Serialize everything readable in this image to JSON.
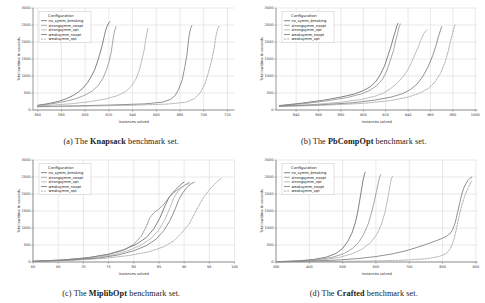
{
  "figure": {
    "axis_titles": {
      "x": "Instances solved",
      "y": "Total runtime in seconds"
    },
    "legend_title": "Configuration",
    "series_names": [
      "no_symm_breaking",
      "strongsymm_noopt",
      "strongsymm_opt",
      "weaksymm_noopt",
      "weaksymm_opt"
    ],
    "series_colors": [
      "#5a5a5a",
      "#8a8a8a",
      "#a8a8a8",
      "#6e6e6e",
      "#9a9a9a"
    ],
    "series_dashes": [
      "none",
      "none",
      "none",
      "none",
      "2,1.2"
    ]
  },
  "panels": [
    {
      "id": "a",
      "caption_prefix": "(a) The ",
      "caption_name": "Knapsack",
      "caption_suffix": " benchmark set.",
      "chart_data": {
        "type": "line",
        "title": "The Knapsack benchmark set.",
        "xlabel": "Instances solved",
        "ylabel": "Total runtime in seconds",
        "xlim": [
          556,
          726
        ],
        "ylim": [
          0,
          3000
        ],
        "xticks": [
          560,
          580,
          600,
          620,
          640,
          660,
          680,
          700,
          720
        ],
        "yticks": [
          0,
          500,
          1000,
          1500,
          2000,
          2500,
          3000
        ],
        "grid": true,
        "legend_position": "upper-left",
        "series": [
          {
            "name": "no_symm_breaking",
            "x": [
              560,
              566,
              572,
              578,
              584,
              590,
              594,
              598,
              602,
              605,
              608,
              610,
              612,
              614,
              615,
              616,
              617,
              618,
              619,
              620,
              621
            ],
            "y": [
              140,
              170,
              210,
              260,
              330,
              430,
              520,
              640,
              800,
              980,
              1180,
              1380,
              1600,
              1850,
              2000,
              2150,
              2300,
              2420,
              2500,
              2560,
              2600
            ]
          },
          {
            "name": "strongsymm_noopt",
            "x": [
              560,
              568,
              576,
              584,
              592,
              600,
              606,
              611,
              615,
              618,
              620,
              622,
              623,
              624,
              625,
              626
            ],
            "y": [
              130,
              165,
              205,
              260,
              330,
              440,
              560,
              720,
              930,
              1180,
              1400,
              1700,
              1950,
              2180,
              2350,
              2450
            ]
          },
          {
            "name": "strongsymm_opt",
            "x": [
              560,
              575,
              590,
              605,
              618,
              628,
              634,
              639,
              643,
              646,
              648,
              650,
              651,
              652,
              653
            ],
            "y": [
              120,
              150,
              190,
              250,
              330,
              430,
              540,
              700,
              920,
              1200,
              1500,
              1800,
              2050,
              2250,
              2400
            ]
          },
          {
            "name": "weaksymm_noopt",
            "x": [
              560,
              590,
              620,
              650,
              665,
              672,
              676,
              679,
              682,
              684,
              686,
              687,
              688,
              689,
              690
            ],
            "y": [
              100,
              120,
              145,
              180,
              230,
              310,
              430,
              620,
              900,
              1250,
              1650,
              2000,
              2250,
              2400,
              2480
            ]
          },
          {
            "name": "weaksymm_opt",
            "x": [
              560,
              600,
              640,
              670,
              685,
              692,
              697,
              701,
              704,
              707,
              709,
              710,
              711,
              712,
              713
            ],
            "y": [
              95,
              115,
              140,
              175,
              230,
              330,
              500,
              760,
              1100,
              1500,
              1850,
              2100,
              2280,
              2400,
              2460
            ]
          }
        ]
      }
    },
    {
      "id": "b",
      "caption_prefix": "(b) The ",
      "caption_name": "PbCompOpt",
      "caption_suffix": " benchmark set.",
      "chart_data": {
        "type": "line",
        "title": "The PbCompOpt benchmark set.",
        "xlabel": "Instances solved",
        "ylabel": "Total runtime in seconds",
        "xlim": [
          822,
          1002
        ],
        "ylim": [
          0,
          3000
        ],
        "xticks": [
          840,
          860,
          880,
          900,
          920,
          940,
          960,
          980,
          1000
        ],
        "yticks": [
          0,
          500,
          1000,
          1500,
          2000,
          2500,
          3000
        ],
        "grid": true,
        "legend_position": "upper-left",
        "series": [
          {
            "name": "no_symm_breaking",
            "x": [
              825,
              845,
              865,
              880,
              892,
              900,
              906,
              911,
              915,
              919,
              922,
              925,
              927,
              929,
              930,
              931
            ],
            "y": [
              130,
              200,
              290,
              380,
              470,
              570,
              680,
              830,
              1030,
              1300,
              1600,
              1900,
              2150,
              2350,
              2480,
              2550
            ]
          },
          {
            "name": "strongsymm_noopt",
            "x": [
              825,
              848,
              870,
              886,
              898,
              906,
              912,
              917,
              921,
              924,
              927,
              929,
              931,
              932,
              933
            ],
            "y": [
              125,
              190,
              280,
              370,
              470,
              580,
              720,
              900,
              1150,
              1450,
              1750,
              2050,
              2300,
              2450,
              2530
            ]
          },
          {
            "name": "strongsymm_opt",
            "x": [
              825,
              855,
              880,
              898,
              910,
              918,
              924,
              930,
              936,
              941,
              945,
              949,
              952,
              954,
              956,
              957
            ],
            "y": [
              115,
              160,
              230,
              310,
              400,
              500,
              620,
              780,
              1000,
              1250,
              1550,
              1850,
              2100,
              2250,
              2330,
              2360
            ]
          },
          {
            "name": "weaksymm_noopt",
            "x": [
              825,
              860,
              890,
              910,
              925,
              935,
              942,
              948,
              953,
              958,
              962,
              965,
              967,
              969,
              970
            ],
            "y": [
              110,
              150,
              210,
              290,
              380,
              480,
              600,
              760,
              980,
              1280,
              1600,
              1900,
              2150,
              2350,
              2450
            ]
          },
          {
            "name": "weaksymm_opt",
            "x": [
              825,
              865,
              900,
              925,
              940,
              950,
              958,
              964,
              969,
              973,
              976,
              978,
              980,
              981,
              982
            ],
            "y": [
              105,
              140,
              195,
              280,
              380,
              490,
              630,
              820,
              1080,
              1400,
              1750,
              2050,
              2280,
              2420,
              2500
            ]
          }
        ]
      }
    },
    {
      "id": "c",
      "caption_prefix": "(c) The ",
      "caption_name": "MiplibOpt",
      "caption_suffix": " benchmark set.",
      "chart_data": {
        "type": "line",
        "title": "The MiplibOpt benchmark set.",
        "xlabel": "Instances solved",
        "ylabel": "Total runtime in seconds",
        "xlim": [
          60,
          100
        ],
        "ylim": [
          0,
          3000
        ],
        "xticks": [
          60,
          65,
          70,
          75,
          80,
          85,
          90,
          95,
          100
        ],
        "yticks": [
          0,
          500,
          1000,
          1500,
          2000,
          2500,
          3000
        ],
        "grid": true,
        "legend_position": "upper-left",
        "series": [
          {
            "name": "no_symm_breaking",
            "x": [
              60,
              66,
              71,
              75,
              78,
              80.5,
              82.5,
              84,
              85.2,
              86.2,
              87,
              87.8,
              88.5,
              89,
              89.5,
              90
            ],
            "y": [
              20,
              60,
              130,
              230,
              360,
              520,
              720,
              980,
              1300,
              1650,
              1900,
              2050,
              2150,
              2230,
              2300,
              2350
            ]
          },
          {
            "name": "strongsymm_noopt",
            "x": [
              60,
              66,
              71,
              75,
              78,
              80,
              81.5,
              82.5,
              83.2,
              84,
              85,
              86,
              87,
              88,
              89,
              90,
              91
            ],
            "y": [
              20,
              60,
              125,
              220,
              350,
              520,
              760,
              1050,
              1300,
              1450,
              1560,
              1700,
              1900,
              2050,
              2150,
              2250,
              2320
            ]
          },
          {
            "name": "strongsymm_opt",
            "x": [
              60,
              67,
              72,
              76,
              79,
              81.5,
              83.5,
              85,
              86.2,
              87.2,
              88,
              88.8,
              89.5,
              90,
              90.5,
              91
            ],
            "y": [
              18,
              55,
              120,
              215,
              340,
              500,
              700,
              950,
              1250,
              1600,
              1900,
              2080,
              2180,
              2250,
              2300,
              2340
            ]
          },
          {
            "name": "weaksymm_noopt",
            "x": [
              60,
              67,
              73,
              77,
              80,
              82.5,
              84.5,
              86,
              87.2,
              88.2,
              89,
              89.8,
              90.5,
              91,
              91.5,
              92
            ],
            "y": [
              18,
              55,
              115,
              210,
              330,
              480,
              680,
              930,
              1220,
              1550,
              1850,
              2050,
              2180,
              2260,
              2310,
              2350
            ]
          },
          {
            "name": "weaksymm_opt",
            "x": [
              60,
              68,
              74,
              79,
              83,
              86,
              88,
              89.5,
              91,
              92,
              93,
              94,
              95,
              96,
              96.8,
              97.5
            ],
            "y": [
              15,
              50,
              105,
              190,
              300,
              450,
              630,
              850,
              1120,
              1400,
              1680,
              1930,
              2120,
              2280,
              2400,
              2470
            ]
          }
        ]
      }
    },
    {
      "id": "d",
      "caption_prefix": "(d) The ",
      "caption_name": "Crafted",
      "caption_suffix": " benchmark set.",
      "chart_data": {
        "type": "line",
        "title": "The Crafted benchmark set.",
        "xlabel": "Instances solved",
        "ylabel": "Total runtime in seconds",
        "xlim": [
          300,
          905
        ],
        "ylim": [
          0,
          3000
        ],
        "xticks": [
          300,
          400,
          500,
          600,
          700,
          800,
          900
        ],
        "yticks": [
          0,
          500,
          1000,
          1500,
          2000,
          2500,
          3000
        ],
        "grid": true,
        "legend_position": "upper-left",
        "series": [
          {
            "name": "no_symm_breaking",
            "x": [
              305,
              360,
              410,
              450,
              480,
              500,
              515,
              528,
              538,
              546,
              552,
              557,
              561,
              564,
              566,
              568
            ],
            "y": [
              10,
              30,
              70,
              140,
              250,
              400,
              600,
              850,
              1150,
              1500,
              1850,
              2150,
              2380,
              2520,
              2600,
              2640
            ]
          },
          {
            "name": "strongsymm_noopt",
            "x": [
              305,
              370,
              425,
              470,
              505,
              530,
              550,
              565,
              578,
              588,
              596,
              602,
              607,
              610,
              613,
              615
            ],
            "y": [
              10,
              30,
              70,
              140,
              250,
              400,
              600,
              850,
              1150,
              1500,
              1820,
              2100,
              2320,
              2460,
              2540,
              2580
            ]
          },
          {
            "name": "strongsymm_opt",
            "x": [
              305,
              380,
              440,
              490,
              530,
              560,
              585,
              603,
              617,
              627,
              634,
              639,
              643,
              646,
              648,
              650
            ],
            "y": [
              8,
              28,
              65,
              135,
              245,
              390,
              580,
              820,
              1120,
              1450,
              1780,
              2060,
              2280,
              2420,
              2490,
              2520
            ]
          },
          {
            "name": "weaksymm_noopt",
            "x": [
              305,
              400,
              480,
              545,
              600,
              650,
              690,
              720,
              745,
              765,
              785,
              800,
              812,
              822,
              830,
              838,
              845,
              852,
              858,
              864,
              870,
              876,
              882,
              888
            ],
            "y": [
              8,
              25,
              55,
              100,
              160,
              240,
              330,
              420,
              500,
              570,
              640,
              700,
              760,
              830,
              940,
              1150,
              1450,
              1750,
              2000,
              2180,
              2300,
              2400,
              2460,
              2500
            ]
          },
          {
            "name": "weaksymm_opt",
            "x": [
              305,
              430,
              530,
              610,
              670,
              715,
              750,
              775,
              795,
              812,
              824,
              833,
              840,
              846,
              852,
              858,
              864,
              870,
              876,
              882,
              888
            ],
            "y": [
              5,
              12,
              22,
              35,
              50,
              70,
              95,
              130,
              180,
              260,
              400,
              620,
              900,
              1180,
              1440,
              1670,
              1860,
              2020,
              2160,
              2280,
              2380
            ]
          }
        ]
      }
    }
  ]
}
